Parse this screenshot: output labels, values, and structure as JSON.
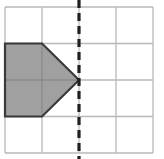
{
  "figure": {
    "title": "Grid with shaded pentagon and vertical dashed line of symmetry",
    "canvas": {
      "width": 164,
      "height": 159
    },
    "background_color": "#ffffff"
  },
  "grid": {
    "name": "square-grid",
    "columns": 4,
    "rows": 4,
    "x_left": 5,
    "y_top": 7,
    "cell_width": 37,
    "cell_height": 36.5,
    "x_lines": [
      5,
      42,
      79,
      116,
      153
    ],
    "y_lines": [
      7,
      43.5,
      80,
      116.5,
      153
    ],
    "line_color": "#b8b8b8",
    "line_width": 1.3,
    "border_color": "#b8b8b8",
    "border_width": 1.3
  },
  "shape": {
    "name": "shaded-pentagon",
    "description": "Pentagon shaped like a rightward-pointing arrow / home shape",
    "vertices": [
      {
        "x": 5,
        "y": 43.5
      },
      {
        "x": 42,
        "y": 43.5
      },
      {
        "x": 79,
        "y": 80
      },
      {
        "x": 42,
        "y": 116.5
      },
      {
        "x": 5,
        "y": 116.5
      }
    ],
    "points_attr": "5,43.5 42,43.5 79,80 42,116.5 5,116.5",
    "fill_color": "#a0a0a0",
    "stroke_color": "#3a3a3a",
    "stroke_width": 2.2,
    "grid_overlay_color": "#8a8a8a",
    "interior_grid_segments": [
      {
        "name": "interior-horizontal-midline",
        "x1": 5,
        "y1": 80,
        "x2": 79,
        "y2": 80
      },
      {
        "name": "interior-vertical-midline",
        "x1": 42,
        "y1": 43.5,
        "x2": 42,
        "y2": 116.5
      }
    ]
  },
  "symmetry_line": {
    "name": "vertical-dashed-line",
    "orientation": "vertical",
    "x": 79,
    "y_start": 0,
    "y_end": 159,
    "color": "#1f1f1f",
    "width": 3.2,
    "dash_pattern": "8 5",
    "touches_shape_apex": true,
    "apex_point": {
      "x": 79,
      "y": 80
    }
  }
}
